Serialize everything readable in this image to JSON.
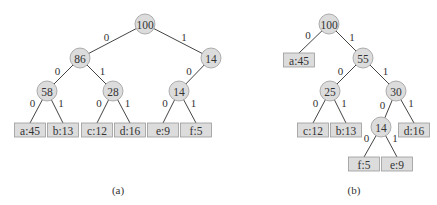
{
  "figure": {
    "trees": [
      {
        "caption": "(a)",
        "description": "Fixed-length code tree",
        "nodes": [
          {
            "id": "a_n100",
            "label": "100",
            "type": "internal",
            "x": 145,
            "y": 24
          },
          {
            "id": "a_n86",
            "label": "86",
            "type": "internal",
            "x": 80,
            "y": 58
          },
          {
            "id": "a_n14r",
            "label": "14",
            "type": "internal",
            "x": 211,
            "y": 58
          },
          {
            "id": "a_n58",
            "label": "58",
            "type": "internal",
            "x": 47,
            "y": 91
          },
          {
            "id": "a_n28",
            "label": "28",
            "type": "internal",
            "x": 113,
            "y": 91
          },
          {
            "id": "a_n14",
            "label": "14",
            "type": "internal",
            "x": 179,
            "y": 91
          },
          {
            "id": "a_la",
            "label": "a:45",
            "type": "leaf",
            "x": 30,
            "y": 130
          },
          {
            "id": "a_lb",
            "label": "b:13",
            "type": "leaf",
            "x": 63,
            "y": 130
          },
          {
            "id": "a_lc",
            "label": "c:12",
            "type": "leaf",
            "x": 97,
            "y": 130
          },
          {
            "id": "a_ld",
            "label": "d:16",
            "type": "leaf",
            "x": 130,
            "y": 130
          },
          {
            "id": "a_le",
            "label": "e:9",
            "type": "leaf",
            "x": 163,
            "y": 130
          },
          {
            "id": "a_lf",
            "label": "f:5",
            "type": "leaf",
            "x": 196,
            "y": 130
          }
        ],
        "edges": [
          {
            "from": "a_n100",
            "to": "a_n86",
            "label": "0"
          },
          {
            "from": "a_n100",
            "to": "a_n14r",
            "label": "1"
          },
          {
            "from": "a_n86",
            "to": "a_n58",
            "label": "0"
          },
          {
            "from": "a_n86",
            "to": "a_n28",
            "label": "1"
          },
          {
            "from": "a_n14r",
            "to": "a_n14",
            "label": "0"
          },
          {
            "from": "a_n58",
            "to": "a_la",
            "label": "0"
          },
          {
            "from": "a_n58",
            "to": "a_lb",
            "label": "1"
          },
          {
            "from": "a_n28",
            "to": "a_lc",
            "label": "0"
          },
          {
            "from": "a_n28",
            "to": "a_ld",
            "label": "1"
          },
          {
            "from": "a_n14",
            "to": "a_le",
            "label": "0"
          },
          {
            "from": "a_n14",
            "to": "a_lf",
            "label": "1"
          }
        ],
        "caption_pos": {
          "x": 118,
          "y": 190
        }
      },
      {
        "caption": "(b)",
        "description": "Optimal prefix (Huffman) code tree",
        "nodes": [
          {
            "id": "b_n100",
            "label": "100",
            "type": "internal",
            "x": 329,
            "y": 24
          },
          {
            "id": "b_la",
            "label": "a:45",
            "type": "leaf",
            "x": 299,
            "y": 60
          },
          {
            "id": "b_n55",
            "label": "55",
            "type": "internal",
            "x": 363,
            "y": 58
          },
          {
            "id": "b_n25",
            "label": "25",
            "type": "internal",
            "x": 330,
            "y": 91
          },
          {
            "id": "b_n30",
            "label": "30",
            "type": "internal",
            "x": 396,
            "y": 91
          },
          {
            "id": "b_lc",
            "label": "c:12",
            "type": "leaf",
            "x": 313,
            "y": 130
          },
          {
            "id": "b_lb",
            "label": "b:13",
            "type": "leaf",
            "x": 346,
            "y": 130
          },
          {
            "id": "b_n14",
            "label": "14",
            "type": "internal",
            "x": 381,
            "y": 127
          },
          {
            "id": "b_ld",
            "label": "d:16",
            "type": "leaf",
            "x": 414,
            "y": 130
          },
          {
            "id": "b_lf",
            "label": "f:5",
            "type": "leaf",
            "x": 364,
            "y": 164
          },
          {
            "id": "b_le",
            "label": "e:9",
            "type": "leaf",
            "x": 397,
            "y": 164
          }
        ],
        "edges": [
          {
            "from": "b_n100",
            "to": "b_la",
            "label": "0"
          },
          {
            "from": "b_n100",
            "to": "b_n55",
            "label": "1"
          },
          {
            "from": "b_n55",
            "to": "b_n25",
            "label": "0"
          },
          {
            "from": "b_n55",
            "to": "b_n30",
            "label": "1"
          },
          {
            "from": "b_n25",
            "to": "b_lc",
            "label": "0"
          },
          {
            "from": "b_n25",
            "to": "b_lb",
            "label": "1"
          },
          {
            "from": "b_n30",
            "to": "b_n14",
            "label": "0"
          },
          {
            "from": "b_n30",
            "to": "b_ld",
            "label": "1"
          },
          {
            "from": "b_n14",
            "to": "b_lf",
            "label": "0"
          },
          {
            "from": "b_n14",
            "to": "b_le",
            "label": "1"
          }
        ],
        "caption_pos": {
          "x": 354,
          "y": 190
        }
      }
    ],
    "colors": {
      "node_fill": "#dcdcdc",
      "node_stroke": "#9a9a9a",
      "edge": "#444444",
      "text": "#333333"
    }
  }
}
